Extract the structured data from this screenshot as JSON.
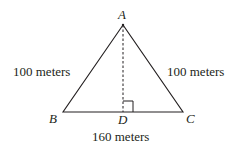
{
  "diagram": {
    "vertices": {
      "A": "A",
      "B": "B",
      "C": "C",
      "D": "D"
    },
    "labels": {
      "AB": "100 meters",
      "AC": "100 meters",
      "BC": "160 meters"
    },
    "line_color": "#231f20"
  }
}
